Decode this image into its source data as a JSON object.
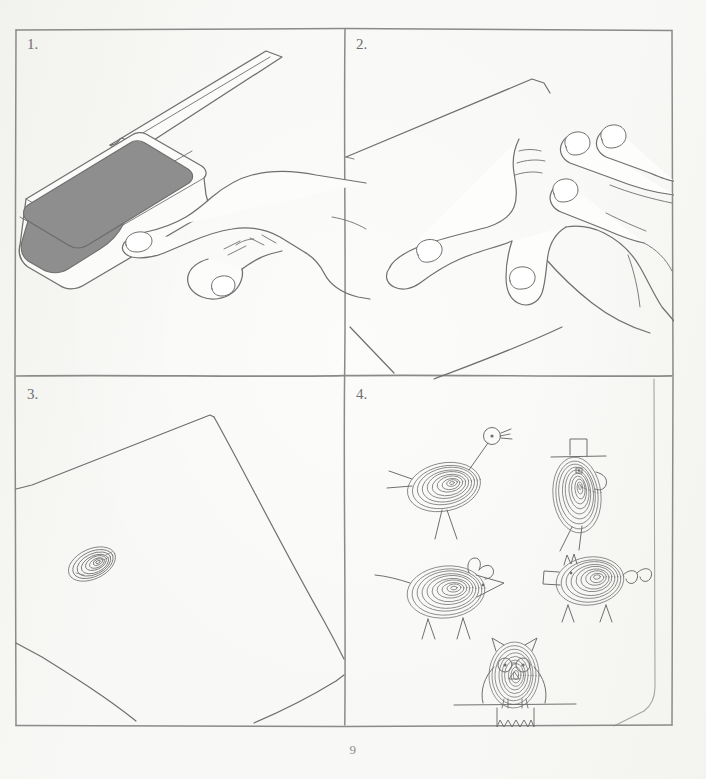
{
  "page": {
    "page_number": "9",
    "background_color": "#f7f7f4",
    "ink_color": "#6b6b6b",
    "pad_color": "#8c8c8c",
    "title_hidden": "Fingerprint animal drawing steps"
  },
  "panels": [
    {
      "id": "panel-1",
      "label": "1.",
      "caption_alt": "Press thumb onto the ink pad",
      "scene": "hand pressing thumb into an open rectangular stamp ink pad",
      "elements": [
        "ink-pad-lid",
        "ink-pad-base",
        "ink-pad-surface",
        "hand",
        "thumb",
        "index-finger"
      ]
    },
    {
      "id": "panel-2",
      "label": "2.",
      "caption_alt": "Press the inked thumb onto the sheet of paper",
      "scene": "hand with extended fingers pressing thumb onto a sheet of paper",
      "elements": [
        "paper-sheet",
        "hand",
        "thumb",
        "fingers"
      ]
    },
    {
      "id": "panel-3",
      "label": "3.",
      "caption_alt": "Fingerprint left on the paper",
      "scene": "tilted sheet of paper with a single oval fingerprint",
      "elements": [
        "paper-sheet",
        "fingerprint"
      ]
    },
    {
      "id": "panel-4",
      "label": "4.",
      "caption_alt": "Draw animals around the fingerprints",
      "scene": "five fingerprint animals drawn with pen details",
      "creatures": [
        {
          "name": "ostrich",
          "features": [
            "long neck",
            "round head",
            "dot eye",
            "beak",
            "tail feathers",
            "two legs"
          ]
        },
        {
          "name": "bird-with-top-hat",
          "features": [
            "top hat",
            "dot eye",
            "wing",
            "two legs"
          ]
        },
        {
          "name": "mouse",
          "features": [
            "pointed snout",
            "dot eye",
            "two ears",
            "tail",
            "two legs"
          ]
        },
        {
          "name": "pig",
          "features": [
            "snout",
            "two ears",
            "curly tail",
            "two legs"
          ]
        },
        {
          "name": "owl",
          "features": [
            "ear tufts",
            "two round eyes",
            "beak",
            "wings",
            "branch perch",
            "tail feathers"
          ]
        }
      ]
    }
  ]
}
